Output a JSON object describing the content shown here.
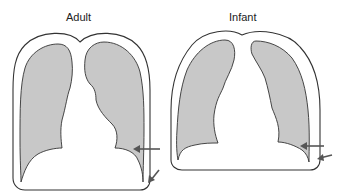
{
  "diagram": {
    "panels": [
      {
        "id": "adult",
        "label": "Adult"
      },
      {
        "id": "infant",
        "label": "Infant"
      }
    ],
    "colors": {
      "lung_fill": "#c8c8c8",
      "outline": "#333333",
      "arrow": "#555555",
      "background": "#ffffff"
    }
  }
}
